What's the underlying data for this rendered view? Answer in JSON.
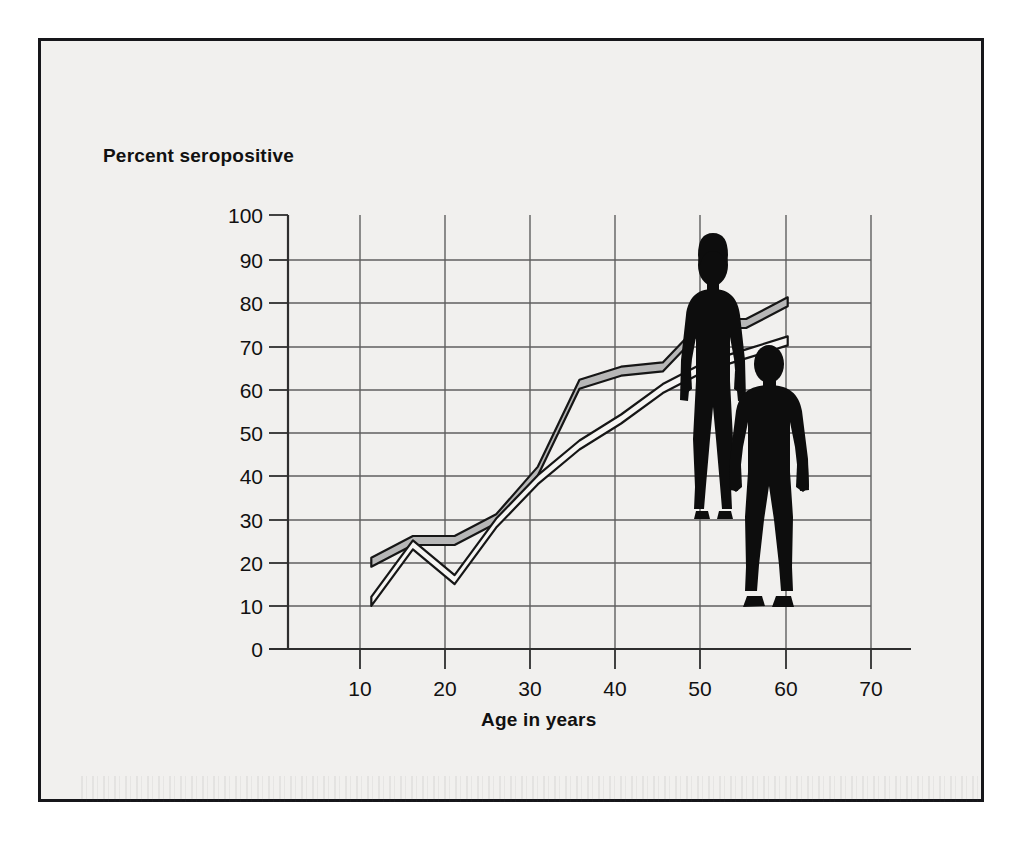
{
  "figure": {
    "background_color": "#f1f0ee",
    "border_color": "#16161a",
    "axis_color": "#3a3a3a",
    "grid_color": "#5a5a5a",
    "line_fill_gray": "#b7b7b7",
    "line_fill_white": "#f6f5f3",
    "line_stroke": "#161616",
    "silhouette_color": "#0d0d0d"
  },
  "labels": {
    "ylabel": "Percent seropositive",
    "xlabel": "Age in years"
  },
  "axes": {
    "x_ticks": [
      "10",
      "20",
      "30",
      "40",
      "50",
      "60",
      "70"
    ],
    "y_ticks": [
      "0",
      "10",
      "20",
      "30",
      "40",
      "50",
      "60",
      "70",
      "80",
      "90",
      "100"
    ]
  },
  "annotations": [
    {
      "name": "female-silhouette",
      "label": "female figure"
    },
    {
      "name": "male-silhouette",
      "label": "male figure"
    }
  ],
  "chart_data": {
    "type": "line",
    "title": "",
    "xlabel": "Age in years",
    "ylabel": "Percent seropositive",
    "xlim": [
      0,
      70
    ],
    "ylim": [
      0,
      100
    ],
    "xticks": [
      10,
      20,
      30,
      40,
      50,
      60,
      70
    ],
    "yticks": [
      0,
      10,
      20,
      30,
      40,
      50,
      60,
      70,
      80,
      90,
      100
    ],
    "grid": true,
    "legend": "none",
    "series": [
      {
        "name": "Female (upper, shaded band)",
        "style": "thick-gray-filled-band",
        "x": [
          10,
          15,
          20,
          25,
          30,
          35,
          40,
          45,
          50,
          55,
          60
        ],
        "values": [
          20,
          25,
          25,
          30,
          41,
          61,
          64,
          65,
          75,
          75,
          80
        ]
      },
      {
        "name": "Male (lower, white-filled band)",
        "style": "thick-white-filled-band",
        "x": [
          10,
          15,
          20,
          25,
          30,
          35,
          40,
          45,
          50,
          55,
          60
        ],
        "values": [
          11,
          24,
          16,
          29,
          39,
          47,
          53,
          60,
          65,
          68,
          71
        ]
      }
    ]
  }
}
